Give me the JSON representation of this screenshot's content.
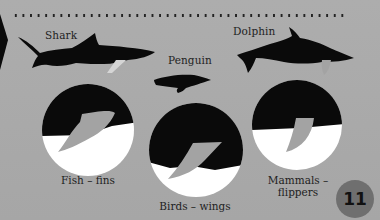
{
  "animals": [
    {
      "name": "Shark"
    },
    {
      "name": "Penguin"
    },
    {
      "name": "Dolphin"
    }
  ],
  "circles": [
    {
      "caption": "Fish – fins"
    },
    {
      "caption": "Birds – wings"
    },
    {
      "caption_line1": "Mammals –",
      "caption_line2": "flippers"
    }
  ],
  "page_number": "11",
  "colors": {
    "background": "#a9a9a9",
    "silhouette": "#0a0a0a",
    "limb": "#a3a3a3",
    "page_badge": "#6f6f6f"
  }
}
